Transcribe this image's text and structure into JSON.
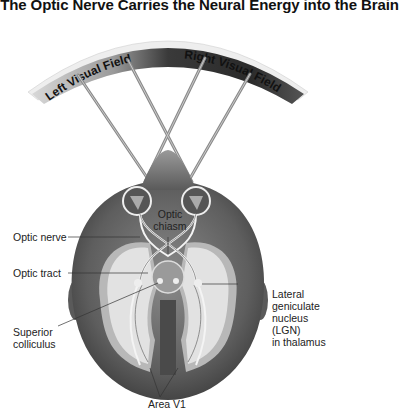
{
  "title": ". The Optic Nerve Carries the Neural Energy into the Brain",
  "visual_fields": {
    "left": "Left Visual Field",
    "right": "Right Visual Field"
  },
  "labels": {
    "optic_chiasm": [
      "Optic",
      "chiasm"
    ],
    "optic_nerve": "Optic nerve",
    "optic_tract": "Optic tract",
    "superior_colliculus": [
      "Superior",
      "colliculus"
    ],
    "lgn": [
      "Lateral",
      "geniculate",
      "nucleus",
      "(LGN)",
      "in thalamus"
    ],
    "area_v1": "Area V1"
  },
  "colors": {
    "arc_light": "#e6e6e6",
    "arc_dark": "#2a2a2a",
    "head_dark": "#4a4a4a",
    "head_mid": "#7a7a7a",
    "cortex_light": "#e2e2e2",
    "cortex_mid": "#b5b5b5",
    "pathway": "#f4f4f4"
  }
}
